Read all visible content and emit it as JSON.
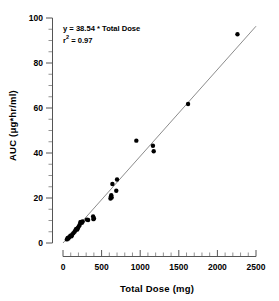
{
  "chart_data": {
    "type": "scatter",
    "title": "",
    "xlabel": "Total Dose (mg)",
    "ylabel": "AUC (μg*hr/ml)",
    "xlim": [
      0,
      2500
    ],
    "ylim": [
      0,
      100
    ],
    "grid": false,
    "legend": null,
    "x_ticks": [
      0,
      500,
      1000,
      1500,
      2000,
      2500
    ],
    "x_tick_labels": [
      "0",
      "500",
      "1000",
      "1500",
      "2000",
      "2500"
    ],
    "x_minor_interval": 100,
    "y_ticks": [
      0,
      20,
      40,
      60,
      80,
      100
    ],
    "y_tick_labels": [
      "0",
      "20",
      "40",
      "60",
      "80",
      "100"
    ],
    "y_minor_interval": 5,
    "marker": "filled-circle",
    "marker_color": "#000000",
    "line_color": "#8c8c8c",
    "annotations": [
      "y = 38.54 * Total Dose",
      "r² = 0.97"
    ],
    "annotation_equation_prefix": "y = 38.54 * Total Dose",
    "annotation_r_prefix": "r",
    "annotation_r_exponent": "2",
    "annotation_r_value": " = 0.97",
    "slope": 38.54,
    "slope_units": "(μg*hr/ml) per g",
    "r_squared": 0.97,
    "fit_line": {
      "x": [
        0,
        2500
      ],
      "y": [
        0,
        96.35
      ]
    },
    "points": [
      {
        "x": 50,
        "y": 1.6
      },
      {
        "x": 60,
        "y": 2.2
      },
      {
        "x": 70,
        "y": 2.0
      },
      {
        "x": 80,
        "y": 2.6
      },
      {
        "x": 95,
        "y": 3.2
      },
      {
        "x": 110,
        "y": 3.0
      },
      {
        "x": 120,
        "y": 3.8
      },
      {
        "x": 135,
        "y": 4.4
      },
      {
        "x": 150,
        "y": 5.0
      },
      {
        "x": 160,
        "y": 5.6
      },
      {
        "x": 170,
        "y": 6.2
      },
      {
        "x": 185,
        "y": 6.0
      },
      {
        "x": 195,
        "y": 6.8
      },
      {
        "x": 205,
        "y": 7.4
      },
      {
        "x": 215,
        "y": 8.0
      },
      {
        "x": 225,
        "y": 9.2
      },
      {
        "x": 235,
        "y": 9.4
      },
      {
        "x": 245,
        "y": 9.0
      },
      {
        "x": 255,
        "y": 9.6
      },
      {
        "x": 310,
        "y": 10.4
      },
      {
        "x": 325,
        "y": 10.2
      },
      {
        "x": 390,
        "y": 11.8
      },
      {
        "x": 395,
        "y": 10.6
      },
      {
        "x": 400,
        "y": 11.0
      },
      {
        "x": 615,
        "y": 19.8
      },
      {
        "x": 620,
        "y": 20.6
      },
      {
        "x": 625,
        "y": 21.2
      },
      {
        "x": 630,
        "y": 20.2
      },
      {
        "x": 640,
        "y": 26.2
      },
      {
        "x": 690,
        "y": 23.2
      },
      {
        "x": 700,
        "y": 28.2
      },
      {
        "x": 950,
        "y": 45.5
      },
      {
        "x": 1165,
        "y": 43.2
      },
      {
        "x": 1175,
        "y": 40.8
      },
      {
        "x": 1620,
        "y": 61.8
      },
      {
        "x": 2260,
        "y": 92.8
      }
    ]
  }
}
